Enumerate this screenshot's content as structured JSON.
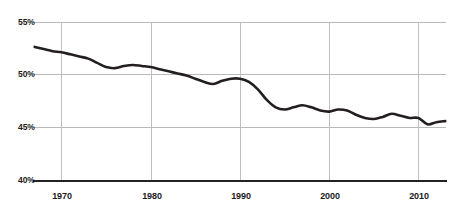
{
  "chart_data": {
    "type": "line",
    "title": "",
    "subtitle": "",
    "xlabel": "",
    "ylabel": "",
    "xlim": [
      1967,
      1913
    ],
    "ylim": [
      40,
      55
    ],
    "grid": true,
    "legend_position": "none",
    "y_ticks": [
      "40%",
      "45%",
      "50%",
      "55%"
    ],
    "y_tick_values": [
      40,
      45,
      50,
      55
    ],
    "x_ticks": [
      "1970",
      "1980",
      "1990",
      "2000",
      "2010"
    ],
    "x_tick_values": [
      1970,
      1980,
      1990,
      2000,
      2010
    ],
    "series": [
      {
        "name": "share",
        "color": "#231f20",
        "x": [
          1967,
          1968,
          1969,
          1970,
          1971,
          1972,
          1973,
          1974,
          1975,
          1976,
          1977,
          1978,
          1979,
          1980,
          1981,
          1982,
          1983,
          1984,
          1985,
          1986,
          1987,
          1988,
          1989,
          1990,
          1991,
          1992,
          1993,
          1994,
          1995,
          1996,
          1997,
          1998,
          1999,
          2000,
          2001,
          2002,
          2003,
          2004,
          2005,
          2006,
          2007,
          2008,
          2009,
          2010,
          2011,
          2012,
          2013
        ],
        "values": [
          52.6,
          52.4,
          52.2,
          52.1,
          51.9,
          51.7,
          51.5,
          51.1,
          50.7,
          50.6,
          50.8,
          50.9,
          50.8,
          50.7,
          50.5,
          50.3,
          50.1,
          49.9,
          49.6,
          49.3,
          49.1,
          49.4,
          49.6,
          49.6,
          49.3,
          48.6,
          47.6,
          46.9,
          46.7,
          46.9,
          47.1,
          46.9,
          46.6,
          46.5,
          46.7,
          46.6,
          46.2,
          45.9,
          45.8,
          46.0,
          46.3,
          46.1,
          45.9,
          45.9,
          45.3,
          45.5,
          45.6
        ]
      }
    ]
  },
  "axes": {
    "y_labels": [
      "55%",
      "50%",
      "45%",
      "40%"
    ],
    "x_labels": [
      "1970",
      "1980",
      "1990",
      "2000",
      "2010"
    ]
  }
}
